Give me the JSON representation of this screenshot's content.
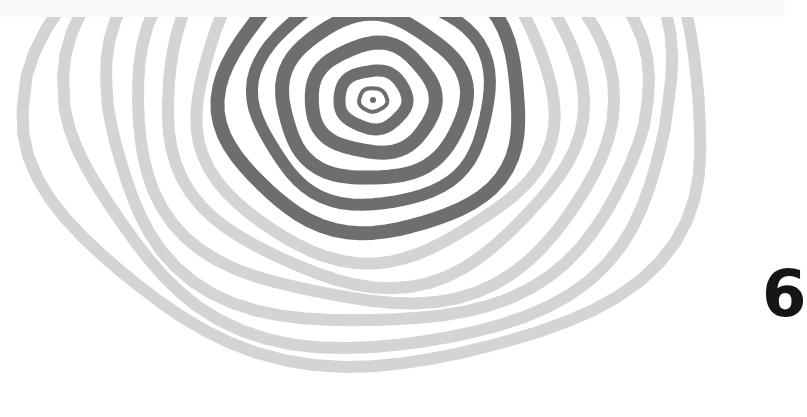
{
  "illustration": {
    "description": "Hand-drawn concentric rings (ripple / tree-ring pattern), clipped flat along the top edge",
    "center": [
      373,
      100
    ],
    "clip_top_y": 17,
    "colors": {
      "background": "#ffffff",
      "top_band": "#fafafa",
      "inner_rings": "#6e6e6e",
      "outer_rings": "#d4d4d4",
      "glyph": "#151515"
    },
    "inner_rings": [
      {
        "rx": 14,
        "ry": 12,
        "width": 4
      },
      {
        "rx": 34,
        "ry": 30,
        "width": 12
      },
      {
        "rx": 62,
        "ry": 56,
        "width": 14
      },
      {
        "rx": 92,
        "ry": 84,
        "width": 14
      },
      {
        "rx": 118,
        "ry": 110,
        "width": 12
      },
      {
        "rx": 150,
        "ry": 140,
        "width": 14
      }
    ],
    "outer_rings": [
      {
        "rx": 178,
        "ry": 168,
        "width": 12
      },
      {
        "rx": 208,
        "ry": 190,
        "width": 12
      },
      {
        "rx": 238,
        "ry": 212,
        "width": 12
      },
      {
        "rx": 270,
        "ry": 232,
        "width": 12
      },
      {
        "rx": 302,
        "ry": 252,
        "width": 12
      },
      {
        "rx": 338,
        "ry": 270,
        "width": 12
      }
    ]
  },
  "edge_glyph": {
    "text": "6"
  }
}
